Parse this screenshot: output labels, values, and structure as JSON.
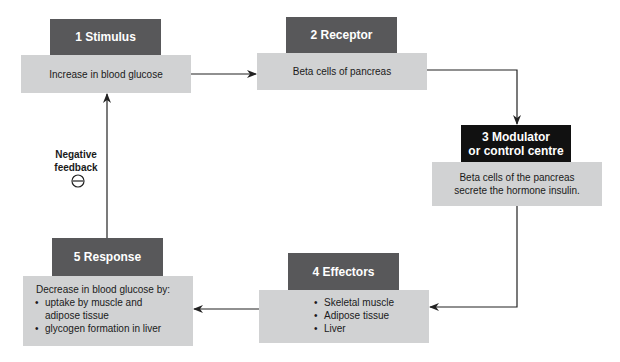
{
  "diagram": {
    "steps": [
      {
        "number": "1",
        "name": "Stimulus",
        "header": "1  Stimulus",
        "text": "Increase in blood glucose"
      },
      {
        "number": "2",
        "name": "Receptor",
        "header": "2  Receptor",
        "text": "Beta cells of pancreas"
      },
      {
        "number": "3",
        "name": "Modulator or control centre",
        "header_line1": "3  Modulator",
        "header_line2": "or control centre",
        "text_line1": "Beta cells of the pancreas",
        "text_line2": "secrete the hormone insulin."
      },
      {
        "number": "4",
        "name": "Effectors",
        "header": "4  Effectors",
        "items": [
          "Skeletal muscle",
          "Adipose tissue",
          "Liver"
        ]
      },
      {
        "number": "5",
        "name": "Response",
        "header": "5  Response",
        "intro": "Decrease in blood glucose by:",
        "items": [
          "uptake by muscle and adipose tissue",
          "glycogen formation in liver"
        ],
        "item1_line1": "uptake by muscle and",
        "item1_line2": "adipose tissue"
      }
    ],
    "feedback": {
      "line1": "Negative",
      "line2": "feedback",
      "symbol": "minus-circle"
    },
    "colors": {
      "header_gray": "#58585a",
      "header_black": "#111111",
      "body_gray": "#d1d2d3",
      "line": "#222222"
    }
  }
}
